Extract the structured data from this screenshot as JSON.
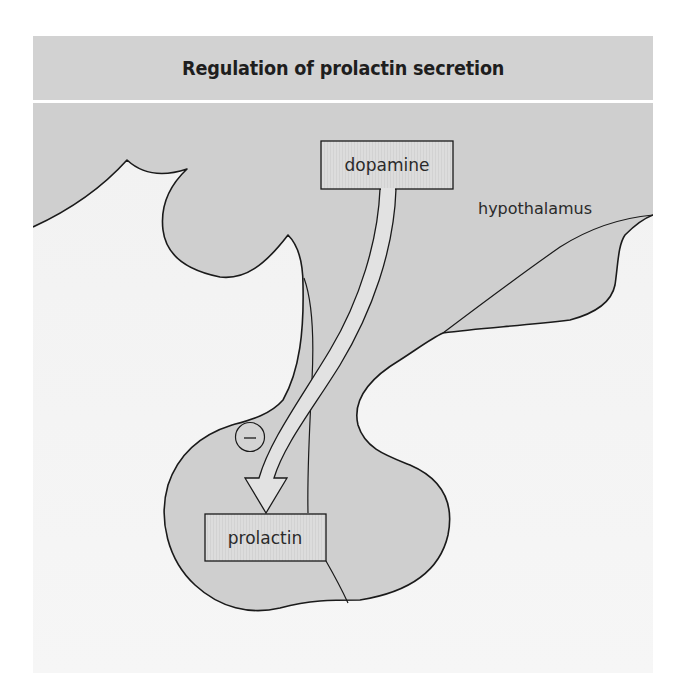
{
  "header": {
    "title": "Regulation of prolactin secretion"
  },
  "diagram": {
    "labels": {
      "dopamine": "dopamine",
      "hypothalamus": "hypothalamus",
      "prolactin": "prolactin",
      "inhibition_symbol": "–"
    },
    "relationships": [
      {
        "from": "dopamine",
        "to": "prolactin",
        "effect": "inhibition",
        "symbol": "–"
      }
    ]
  },
  "colors": {
    "header_bg": "#d2d2d2",
    "tissue_fill": "#cfcfcf",
    "background_fill": "#f4f4f4",
    "box_fill": "#dadada",
    "arrow_fill": "#e2e2e2",
    "outline": "#1a1a1a",
    "divider": "#ffffff"
  }
}
